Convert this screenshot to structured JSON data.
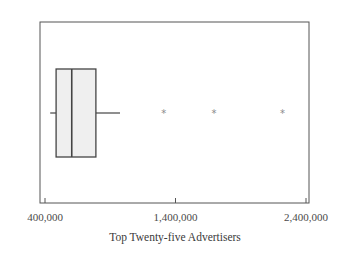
{
  "chart_data": {
    "type": "boxplot",
    "orientation": "horizontal",
    "title": "",
    "xlabel": "Top Twenty-five Advertisers",
    "ylabel": "",
    "xlim": [
      385000,
      2405000
    ],
    "ticks": [
      400000,
      1400000,
      2400000
    ],
    "tick_labels": [
      "400,000",
      "1,400,000",
      "2,400,000"
    ],
    "grid": false,
    "legend": null,
    "box": {
      "whisker_low": 440000,
      "q1": 485000,
      "median": 605000,
      "q3": 790000,
      "whisker_high": 975000
    },
    "outliers": [
      1310000,
      1695000,
      2220000
    ],
    "outlier_symbol": "*"
  },
  "colors": {
    "frame": "#555555",
    "box_fill": "#efefef",
    "box_stroke": "#444444",
    "outlier": "#8a8a8a"
  }
}
